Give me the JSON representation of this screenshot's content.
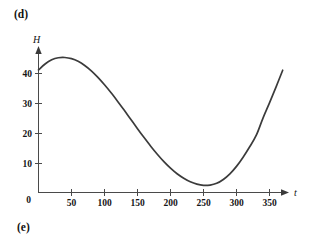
{
  "figure": {
    "part_label_d": "(d)",
    "part_label_e": "(e)"
  },
  "chart_data": {
    "type": "line",
    "title": "",
    "subtitle": "",
    "xlabel": "t",
    "ylabel": "H",
    "xlim": [
      0,
      378
    ],
    "ylim": [
      0,
      48
    ],
    "grid": false,
    "legend": null,
    "annotations": [],
    "x_ticks": [
      0,
      50,
      100,
      150,
      200,
      250,
      300,
      350
    ],
    "x_tick_labels": [
      "0",
      "50",
      "100",
      "150",
      "200",
      "250",
      "300",
      "350"
    ],
    "y_ticks": [
      0,
      10,
      20,
      30,
      40
    ],
    "y_tick_labels": [
      "0",
      "10",
      "20",
      "30",
      "40"
    ],
    "series": [
      {
        "name": "H",
        "color": "#3b3b3b",
        "x": [
          0,
          10,
          20,
          30,
          40,
          50,
          60,
          70,
          80,
          90,
          100,
          110,
          120,
          130,
          140,
          150,
          160,
          170,
          180,
          190,
          200,
          210,
          220,
          230,
          240,
          250,
          260,
          270,
          280,
          290,
          300,
          310,
          320,
          330,
          340,
          350,
          360,
          370
        ],
        "y": [
          41.3,
          43.3,
          44.7,
          45.4,
          45.5,
          45.1,
          44.2,
          42.8,
          41.0,
          38.8,
          36.3,
          33.6,
          30.7,
          27.7,
          24.6,
          21.5,
          18.5,
          15.6,
          12.9,
          10.4,
          8.2,
          6.3,
          4.8,
          3.6,
          2.8,
          2.4,
          2.5,
          3.1,
          4.4,
          6.3,
          8.8,
          11.9,
          15.4,
          19.3,
          25.0,
          30.2,
          35.6,
          41.2
        ]
      }
    ],
    "key_points": {
      "start": {
        "t": 0,
        "H": 41.3
      },
      "maximum": {
        "t": 40,
        "H": 45.5
      },
      "minimum": {
        "t": 250,
        "H": 2.4
      },
      "end": {
        "t": 370,
        "H": 41.2
      }
    }
  }
}
